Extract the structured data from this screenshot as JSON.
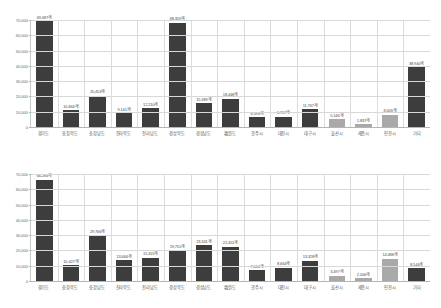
{
  "chart_data": [
    {
      "type": "bar",
      "title": "",
      "xlabel": "",
      "ylabel": "",
      "ylim": [
        0,
        70000
      ],
      "grid": true,
      "legend": "none",
      "yticks": [
        "70,000",
        "60,000",
        "50,000",
        "40,000",
        "30,000",
        "20,000",
        "10,000",
        "0"
      ],
      "ytick_values": [
        70000,
        60000,
        50000,
        40000,
        30000,
        20000,
        10000,
        0
      ],
      "categories": [
        "경기도",
        "충청북도",
        "충청남도",
        "전라북도",
        "전라남도",
        "경상북도",
        "경상남도",
        "強원도",
        "광주시",
        "대전시",
        "대구시",
        "울산시",
        "세종시",
        "인천시",
        "기타"
      ],
      "values": [
        69087,
        10844,
        20453,
        9141,
        12210,
        68359,
        15389,
        18448,
        6593,
        6707,
        11767,
        5146,
        1837,
        8003,
        38940
      ],
      "value_labels": [
        "69,087개",
        "10,844개",
        "20,453개",
        "9,141개",
        "12,210개",
        "68,359개",
        "15,389개",
        "18,448개",
        "6,593개",
        "6,707개",
        "11,767개",
        "5,146개",
        "1,837개",
        "8,003개",
        "38,940개"
      ],
      "bar_shades": [
        "dark",
        "dark",
        "dark",
        "dark",
        "dark",
        "dark",
        "dark",
        "dark",
        "dark",
        "dark",
        "dark",
        "light",
        "light",
        "light",
        "dark"
      ]
    },
    {
      "type": "bar",
      "title": "",
      "xlabel": "",
      "ylabel": "",
      "ylim": [
        0,
        70000
      ],
      "grid": true,
      "legend": "none",
      "yticks": [
        "70,000",
        "60,000",
        "50,000",
        "40,000",
        "30,000",
        "20,000",
        "10,000",
        "0"
      ],
      "ytick_values": [
        70000,
        60000,
        50000,
        40000,
        30000,
        20000,
        10000,
        0
      ],
      "categories": [
        "경기도",
        "충청북도",
        "충청남도",
        "전라북도",
        "전라남도",
        "경상북도",
        "경상남도",
        "強원도",
        "광주시",
        "대전시",
        "대구시",
        "울산시",
        "세종시",
        "인천시",
        "기타"
      ],
      "values": [
        66284,
        10427,
        29766,
        13664,
        15321,
        19755,
        23341,
        22451,
        7044,
        8664,
        13328,
        3497,
        2006,
        14488,
        8544
      ],
      "value_labels": [
        "66,284개",
        "10,427개",
        "29,766개",
        "13,664개",
        "15,321개",
        "19,755개",
        "23,341개",
        "22,451개",
        "7,044개",
        "8,664개",
        "13,328개",
        "3,497개",
        "2,006개",
        "14,488개",
        "8,544개"
      ],
      "bar_shades": [
        "dark",
        "dark",
        "dark",
        "dark",
        "dark",
        "dark",
        "dark",
        "dark",
        "dark",
        "dark",
        "dark",
        "light",
        "light",
        "light",
        "dark"
      ]
    }
  ]
}
